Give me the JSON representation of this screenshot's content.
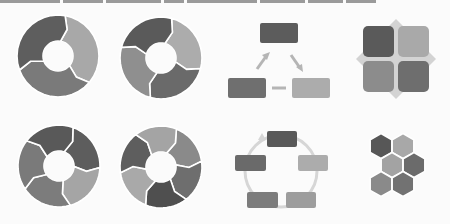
{
  "palette": {
    "dark": "#585858",
    "mid_dark": "#6d6d6d",
    "mid": "#8a8a8a",
    "light": "#a9a9a9",
    "lighter": "#bcbcbc",
    "connector": "#c4c4c4",
    "diamond": "#d2d2d2",
    "separator": "#ffffff",
    "background": "#fbfbfb"
  },
  "icons": [
    {
      "id": "ring-3-segments",
      "label": "3-step circular arrow cycle",
      "segments": 3
    },
    {
      "id": "ring-4-segments",
      "label": "4-step circular arrow cycle",
      "segments": 4
    },
    {
      "id": "triangle-flow",
      "label": "3-box triangular flow",
      "boxes": 3
    },
    {
      "id": "quad-grid",
      "label": "2x2 square matrix with diamond",
      "cells": 4
    },
    {
      "id": "ring-5-segments",
      "label": "5-step circular arrow cycle",
      "segments": 5
    },
    {
      "id": "ring-6-segments",
      "label": "6-step circular arrow cycle",
      "segments": 6
    },
    {
      "id": "box-cycle",
      "label": "5-box circular cycle",
      "boxes": 5
    },
    {
      "id": "hex-cluster",
      "label": "6-hexagon honeycomb cluster",
      "cells": 6
    }
  ]
}
